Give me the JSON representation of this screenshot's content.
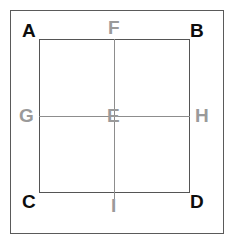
{
  "figure": {
    "canvas": {
      "width": 236,
      "height": 250,
      "background": "#ffffff"
    },
    "colors": {
      "vertex_label": "#0d0d0d",
      "midpoint_label": "#9a9a9a",
      "square_stroke": "#555555",
      "median_stroke": "#8d8d8d",
      "outer_frame_stroke": "#5a5a5a"
    },
    "labels": {
      "a": "A",
      "b": "B",
      "c": "C",
      "d": "D",
      "e": "E",
      "f": "F",
      "g": "G",
      "h": "H",
      "i": "I"
    }
  }
}
